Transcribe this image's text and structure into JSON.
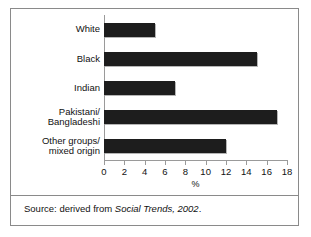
{
  "chart_data": {
    "type": "bar",
    "orientation": "horizontal",
    "title": "",
    "xlabel": "%",
    "ylabel": "",
    "xlim": [
      0,
      18
    ],
    "grid": false,
    "legend": null,
    "categories": [
      "White",
      "Black",
      "Indian",
      "Pakistani/\nBangladeshi",
      "Other groups/\nmixed origin"
    ],
    "values": [
      5,
      15,
      7,
      17,
      12
    ],
    "tick_values": [
      0,
      2,
      4,
      6,
      8,
      10,
      12,
      14,
      16,
      18
    ],
    "tick_labels": [
      "0",
      "2",
      "4",
      "6",
      "8",
      "10",
      "12",
      "14",
      "16",
      "18"
    ],
    "bar_color": "#1d1d1d",
    "axis_color": "#9a9a9a"
  },
  "footer": {
    "source_prefix": "Source: derived from ",
    "source_italic": "Social Trends, 2002",
    "source_suffix": "."
  }
}
